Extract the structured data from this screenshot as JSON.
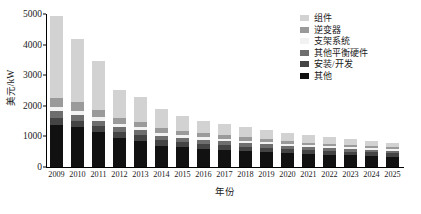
{
  "chart_data": {
    "type": "bar",
    "stacked": true,
    "title": "",
    "xlabel": "年份",
    "ylabel": "美元/kW",
    "ylim": [
      0,
      5000
    ],
    "yticks": [
      0,
      1000,
      2000,
      3000,
      4000,
      5000
    ],
    "ytick_labels": [
      "0",
      "1000",
      "2000",
      "3000",
      "4000",
      "5000"
    ],
    "grid": false,
    "legend_position": "top-right",
    "categories": [
      "2009",
      "2010",
      "2011",
      "2012",
      "2013",
      "2014",
      "2015",
      "2016",
      "2017",
      "2018",
      "2019",
      "2020",
      "2021",
      "2022",
      "2023",
      "2024",
      "2025"
    ],
    "series": [
      {
        "name": "其他",
        "color": "#111111",
        "values": [
          1380,
          1300,
          1130,
          940,
          860,
          700,
          640,
          600,
          560,
          520,
          490,
          450,
          420,
          400,
          380,
          360,
          340
        ]
      },
      {
        "name": "安装/开发",
        "color": "#444444",
        "values": [
          230,
          215,
          200,
          190,
          180,
          175,
          165,
          160,
          155,
          150,
          145,
          140,
          135,
          130,
          125,
          120,
          115
        ]
      },
      {
        "name": "其他平衡硬件",
        "color": "#6e6e6e",
        "values": [
          220,
          200,
          185,
          170,
          160,
          150,
          140,
          130,
          125,
          118,
          112,
          105,
          100,
          95,
          90,
          85,
          80
        ]
      },
      {
        "name": "支架系统",
        "color": "#f2f2f2",
        "values": [
          140,
          130,
          120,
          110,
          100,
          95,
          90,
          85,
          80,
          76,
          72,
          68,
          64,
          60,
          57,
          54,
          50
        ]
      },
      {
        "name": "逆变器",
        "color": "#9a9a9a",
        "values": [
          300,
          270,
          235,
          200,
          180,
          160,
          140,
          125,
          115,
          105,
          95,
          88,
          82,
          76,
          70,
          65,
          60
        ]
      },
      {
        "name": "组件",
        "color": "#d2d2d2",
        "values": [
          2680,
          2060,
          1590,
          900,
          810,
          620,
          480,
          420,
          375,
          340,
          300,
          265,
          235,
          210,
          185,
          165,
          150
        ]
      }
    ],
    "totals": [
      4950,
      4175,
      3460,
      2510,
      2290,
      1900,
      1655,
      1520,
      1410,
      1309,
      1214,
      1116,
      1036,
      971,
      907,
      849,
      795
    ]
  },
  "legend": {
    "items": [
      {
        "label": "组件",
        "color": "#d2d2d2"
      },
      {
        "label": "逆变器",
        "color": "#9a9a9a"
      },
      {
        "label": "支架系统",
        "color": "#f2f2f2"
      },
      {
        "label": "其他平衡硬件",
        "color": "#6e6e6e"
      },
      {
        "label": "安装/开发",
        "color": "#444444"
      },
      {
        "label": "其他",
        "color": "#111111"
      }
    ]
  }
}
